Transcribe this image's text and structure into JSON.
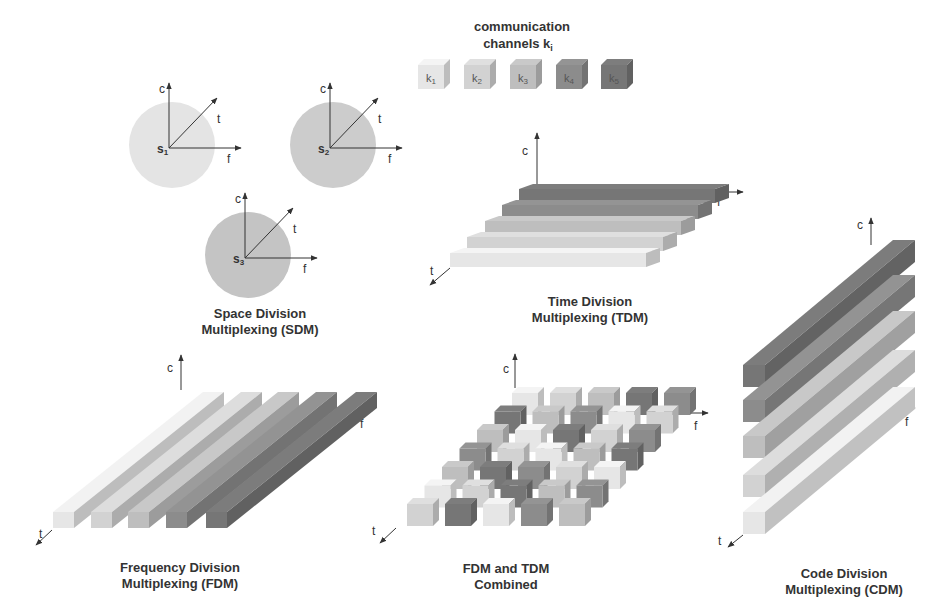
{
  "legend": {
    "title_line1": "communication",
    "title_line2": "channels k",
    "title_sub": "i",
    "channels": [
      {
        "label": "k",
        "sub": "1",
        "color": "#e6e6e6"
      },
      {
        "label": "k",
        "sub": "2",
        "color": "#d2d2d2"
      },
      {
        "label": "k",
        "sub": "3",
        "color": "#bebebe"
      },
      {
        "label": "k",
        "sub": "4",
        "color": "#8c8c8c"
      },
      {
        "label": "k",
        "sub": "5",
        "color": "#767676"
      }
    ]
  },
  "axes": {
    "c": "c",
    "t": "t",
    "f": "f"
  },
  "sdm": {
    "title_line1": "Space Division",
    "title_line2": "Multiplexing (SDM)",
    "senders": [
      {
        "label": "s",
        "sub": "1",
        "color": "#e4e4e4"
      },
      {
        "label": "s",
        "sub": "2",
        "color": "#cccccc"
      },
      {
        "label": "s",
        "sub": "3",
        "color": "#c4c4c4"
      }
    ]
  },
  "tdm": {
    "title_line1": "Time Division",
    "title_line2": "Multiplexing (TDM)"
  },
  "fdm": {
    "title_line1": "Frequency Division",
    "title_line2": "Multiplexing (FDM)"
  },
  "combined": {
    "title_line1": "FDM and TDM",
    "title_line2": "Combined"
  },
  "cdm": {
    "title_line1": "Code Division",
    "title_line2": "Multiplexing (CDM)"
  }
}
